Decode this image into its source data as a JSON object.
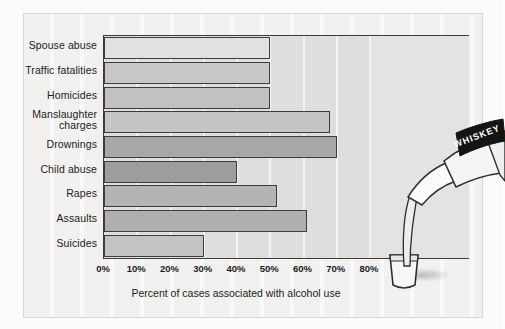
{
  "figure": {
    "background_color": "#f2f1f0",
    "plot_background_color": "#dededd"
  },
  "chart_data": {
    "type": "bar",
    "orientation": "horizontal",
    "title": "",
    "xlabel": "Percent of cases associated with alcohol use",
    "ylabel": "",
    "xlim": [
      0,
      80
    ],
    "grid": true,
    "legend": "none",
    "categories": [
      "Spouse abuse",
      "Traffic fatalities",
      "Homicides",
      "Manslaughter\ncharges",
      "Drownings",
      "Child abuse",
      "Rapes",
      "Assaults",
      "Suicides"
    ],
    "values": [
      50,
      50,
      50,
      68,
      70,
      40,
      52,
      61,
      30
    ],
    "bar_colors": [
      "#e2e1e0",
      "#c9c8c6",
      "#c2c1bf",
      "#c6c5c3",
      "#a9a8a6",
      "#9e9d9b",
      "#b5b4b2",
      "#b0afad",
      "#c4c3c1"
    ],
    "xticks": [
      0,
      10,
      20,
      30,
      40,
      50,
      60,
      70,
      80
    ],
    "xticklabels": [
      "0%",
      "10%",
      "20%",
      "30%",
      "40%",
      "50%",
      "60%",
      "70%",
      "80%"
    ]
  },
  "illustration": {
    "name": "whiskey-bottle-pouring",
    "bottle_label_text": "WHISKEY",
    "glass": "shot-glass"
  }
}
